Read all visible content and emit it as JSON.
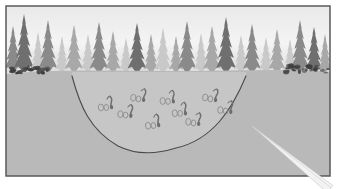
{
  "figure": {
    "title": "Forest basin cross-section illustration",
    "caption": "",
    "page_background": "#ffffff"
  },
  "frame": {
    "name": "illustration-frame",
    "x": 6,
    "y": 6,
    "width": 324,
    "height": 170,
    "border_color": "#595959",
    "border_width": 1.5
  },
  "sky": {
    "label": "sky",
    "top_color": "#e9e9e9",
    "mid_color": "#f4f4f4",
    "bottom_color": "#dcdcdc",
    "horizon_y": 72
  },
  "ground": {
    "label": "ground",
    "fill_color": "#b9b9b9",
    "top_y": 70,
    "texture_opacity": 0.16
  },
  "basin": {
    "label": "depression-basin",
    "fill_color": "#c6c6c6",
    "outline_color": "#4a4a4a",
    "outline_width": 1.1,
    "left_rim_x": 72,
    "right_rim_x": 246,
    "floor_y": 152,
    "rim_y": 76
  },
  "treeline": {
    "label": "conifer-treeline",
    "base_y": 72,
    "shades": {
      "far": "#c9c9c9",
      "mid": "#a8a8a8",
      "near": "#8a8a8a",
      "dark": "#6f6f6f"
    },
    "trees": [
      {
        "x": 13,
        "h": 46,
        "w": 17,
        "shade": "near"
      },
      {
        "x": 24,
        "h": 58,
        "w": 20,
        "shade": "dark"
      },
      {
        "x": 38,
        "h": 40,
        "w": 15,
        "shade": "far"
      },
      {
        "x": 48,
        "h": 52,
        "w": 19,
        "shade": "near"
      },
      {
        "x": 62,
        "h": 36,
        "w": 14,
        "shade": "far"
      },
      {
        "x": 74,
        "h": 47,
        "w": 18,
        "shade": "mid"
      },
      {
        "x": 88,
        "h": 38,
        "w": 15,
        "shade": "far"
      },
      {
        "x": 99,
        "h": 50,
        "w": 19,
        "shade": "near"
      },
      {
        "x": 113,
        "h": 41,
        "w": 16,
        "shade": "mid"
      },
      {
        "x": 126,
        "h": 34,
        "w": 14,
        "shade": "far"
      },
      {
        "x": 137,
        "h": 49,
        "w": 19,
        "shade": "dark"
      },
      {
        "x": 151,
        "h": 38,
        "w": 15,
        "shade": "mid"
      },
      {
        "x": 163,
        "h": 44,
        "w": 17,
        "shade": "far"
      },
      {
        "x": 176,
        "h": 36,
        "w": 14,
        "shade": "mid"
      },
      {
        "x": 187,
        "h": 51,
        "w": 19,
        "shade": "near"
      },
      {
        "x": 201,
        "h": 39,
        "w": 15,
        "shade": "far"
      },
      {
        "x": 212,
        "h": 46,
        "w": 18,
        "shade": "mid"
      },
      {
        "x": 226,
        "h": 55,
        "w": 20,
        "shade": "dark"
      },
      {
        "x": 241,
        "h": 37,
        "w": 15,
        "shade": "far"
      },
      {
        "x": 252,
        "h": 48,
        "w": 18,
        "shade": "near"
      },
      {
        "x": 266,
        "h": 35,
        "w": 14,
        "shade": "far"
      },
      {
        "x": 277,
        "h": 43,
        "w": 17,
        "shade": "mid"
      },
      {
        "x": 290,
        "h": 33,
        "w": 13,
        "shade": "far"
      },
      {
        "x": 300,
        "h": 52,
        "w": 19,
        "shade": "near"
      },
      {
        "x": 314,
        "h": 45,
        "w": 17,
        "shade": "dark"
      },
      {
        "x": 325,
        "h": 38,
        "w": 14,
        "shade": "mid"
      }
    ]
  },
  "brush": {
    "label": "shoreline-brush",
    "color": "#3d3d3d",
    "patches": [
      {
        "x": 8,
        "y": 68,
        "w": 40,
        "h": 6
      },
      {
        "x": 286,
        "y": 66,
        "w": 44,
        "h": 7
      }
    ]
  },
  "organisms": {
    "label": "organism-clusters",
    "count": 9,
    "body_color": "#6e6e6e",
    "egg_color": "#8d8d8d",
    "clusters": [
      {
        "id": 1,
        "x": 108,
        "y": 104,
        "rot": -8
      },
      {
        "id": 2,
        "x": 141,
        "y": 96,
        "rot": 6
      },
      {
        "id": 3,
        "x": 170,
        "y": 98,
        "rot": -4
      },
      {
        "id": 4,
        "x": 213,
        "y": 96,
        "rot": 8
      },
      {
        "id": 5,
        "x": 155,
        "y": 122,
        "rot": -10
      },
      {
        "id": 6,
        "x": 196,
        "y": 120,
        "rot": 5
      },
      {
        "id": 7,
        "x": 128,
        "y": 112,
        "rot": 3
      },
      {
        "id": 8,
        "x": 182,
        "y": 110,
        "rot": -6
      },
      {
        "id": 9,
        "x": 228,
        "y": 108,
        "rot": 4
      }
    ]
  },
  "pointer": {
    "label": "pointer-stylus",
    "color": "#f2f2f2",
    "edge_color": "#cfcfcf",
    "tip_x": 252,
    "tip_y": 126,
    "base_x": 330,
    "base_y": 189
  }
}
